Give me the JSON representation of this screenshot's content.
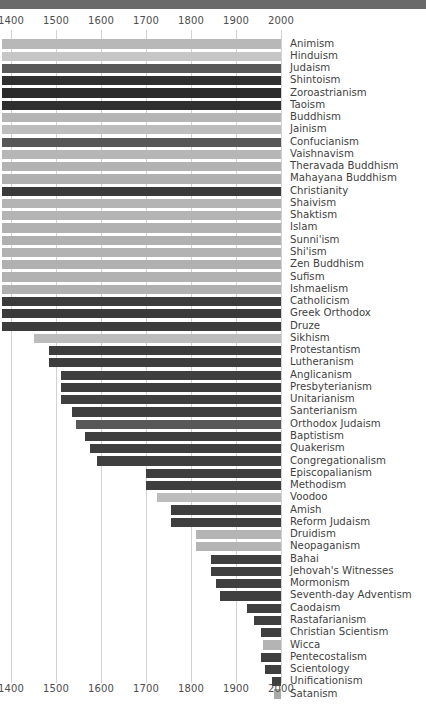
{
  "header": {
    "band_color": "#6a6a6a"
  },
  "axis": {
    "ticks": [
      1400,
      1500,
      1600,
      1700,
      1800,
      1900,
      2000
    ],
    "tick_labels": [
      "1400",
      "1500",
      "1600",
      "1700",
      "1800",
      "1900",
      "2000"
    ],
    "min": 1400,
    "max": 2000,
    "left_px": 11,
    "right_px": 281,
    "label_color": "#4d4d4d",
    "gridline_color": "#d2d2d2"
  },
  "chart_data": {
    "type": "bar",
    "title": "",
    "subtitle": "",
    "xlabel": "",
    "ylabel": "",
    "xlim": [
      1400,
      2000
    ],
    "grid": true,
    "legend": "none",
    "note": "Horizontal timeline bars: each bar spans from the religion's founding year to the present (2000). Bars whose founding predates 1400 are clipped at the left edge of the plot.",
    "categories": [
      "Animism",
      "Hinduism",
      "Judaism",
      "Shintoism",
      "Zoroastrianism",
      "Taoism",
      "Buddhism",
      "Jainism",
      "Confucianism",
      "Vaishnavism",
      "Theravada Buddhism",
      "Mahayana Buddhism",
      "Christianity",
      "Shaivism",
      "Shaktism",
      "Islam",
      "Sunni'ism",
      "Shi'ism",
      "Zen Buddhism",
      "Sufism",
      "Ishmaelism",
      "Catholicism",
      "Greek Orthodox",
      "Druze",
      "Sikhism",
      "Protestantism",
      "Lutheranism",
      "Anglicanism",
      "Presbyterianism",
      "Unitarianism",
      "Santerianism",
      "Orthodox Judaism",
      "Baptistism",
      "Quakerism",
      "Congregationalism",
      "Episcopalianism",
      "Methodism",
      "Voodoo",
      "Amish",
      "Reform Judaism",
      "Druidism",
      "Neopaganism",
      "Bahai",
      "Jehovah's Witnesses",
      "Mormonism",
      "Seventh-day Adventism",
      "Caodaism",
      "Rastafarianism",
      "Christian Scientism",
      "Wicca",
      "Pentecostalism",
      "Scientology",
      "Unificationism",
      "Satanism"
    ],
    "start_years": [
      1380,
      1380,
      1380,
      1380,
      1380,
      1380,
      1380,
      1380,
      1380,
      1380,
      1380,
      1380,
      1380,
      1380,
      1380,
      1380,
      1380,
      1380,
      1380,
      1380,
      1380,
      1380,
      1380,
      1380,
      1450,
      1485,
      1485,
      1510,
      1510,
      1510,
      1535,
      1545,
      1565,
      1575,
      1590,
      1700,
      1700,
      1725,
      1755,
      1755,
      1810,
      1810,
      1845,
      1845,
      1855,
      1865,
      1925,
      1940,
      1955,
      1960,
      1955,
      1965,
      1980,
      1985
    ],
    "end_year": 2000,
    "bar_colors": [
      "#b8b8b8",
      "#c6c6c6",
      "#595959",
      "#2f2f2f",
      "#2b2b2b",
      "#2f2f2f",
      "#b5b5b5",
      "#bdbdbd",
      "#575757",
      "#b6b6b6",
      "#b2b2b2",
      "#b0b0b0",
      "#3a3a3a",
      "#b4b4b4",
      "#b4b4b4",
      "#b1b1b1",
      "#b0b0b0",
      "#b2b2b2",
      "#b0b0b0",
      "#b2b2b2",
      "#b0b0b0",
      "#3c3c3c",
      "#3a3a3a",
      "#3c3c3c",
      "#bcbcbc",
      "#3d3d3d",
      "#3d3d3d",
      "#3f3f3f",
      "#3e3e3e",
      "#3f3f3f",
      "#3e3e3e",
      "#585858",
      "#3f3f3f",
      "#3f3f3f",
      "#3f3f3f",
      "#3e3e3e",
      "#3e3e3e",
      "#bcbcbc",
      "#3f3f3f",
      "#3f3f3f",
      "#b4b4b4",
      "#b4b4b4",
      "#3f3f3f",
      "#3f3f3f",
      "#3f3f3f",
      "#3f3f3f",
      "#3f3f3f",
      "#3f3f3f",
      "#3f3f3f",
      "#b4b4b4",
      "#3f3f3f",
      "#3f3f3f",
      "#3f3f3f",
      "#aaaaaa"
    ]
  }
}
